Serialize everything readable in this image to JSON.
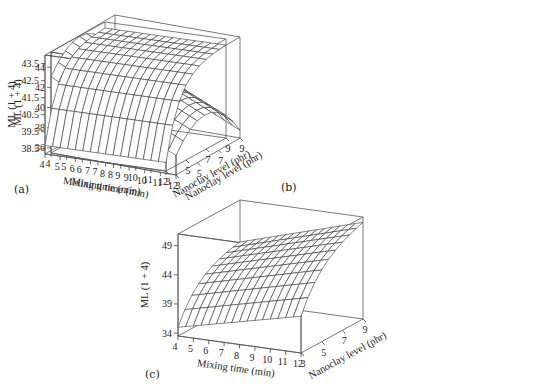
{
  "figure": {
    "panels": [
      {
        "label": "(a)",
        "ylabel": "ML (1 + 4)",
        "xlabel": "Mixing time (min)",
        "zlabel": "Nanoclay level (phr)",
        "yticks": [
          "36",
          "38",
          "40",
          "42",
          "44"
        ],
        "xticks": [
          "4",
          "5",
          "6",
          "7",
          "8",
          "9",
          "10",
          "11",
          "12"
        ],
        "zticks": [
          "3",
          "5",
          "7",
          "9"
        ]
      },
      {
        "label": "(b)",
        "ylabel": "ML (1 + 4)",
        "xlabel": "Mixing time (min)",
        "zlabel": "Nanoclay level (phr)",
        "yticks": [
          "38.5",
          "39.5",
          "40.5",
          "41.5",
          "42.5",
          "43.5"
        ],
        "xticks": [
          "4",
          "5",
          "6",
          "7",
          "8",
          "9",
          "10",
          "11",
          "12"
        ],
        "zticks": [
          "3",
          "5",
          "7",
          "9"
        ]
      },
      {
        "label": "(c)",
        "ylabel": "ML (1 + 4)",
        "xlabel": "Mixing time (min)",
        "zlabel": "Nanoclay level (phr)",
        "yticks": [
          "34",
          "39",
          "44",
          "49"
        ],
        "xticks": [
          "4",
          "5",
          "6",
          "7",
          "8",
          "9",
          "10",
          "11",
          "12"
        ],
        "zticks": [
          "3",
          "5",
          "7",
          "9"
        ]
      }
    ]
  },
  "chart_data": [
    {
      "type": "surface",
      "title": "(a)",
      "xlabel": "Mixing time (min)",
      "ylabel": "Nanoclay level (phr)",
      "zlabel": "ML (1 + 4)",
      "x_range": [
        4,
        12
      ],
      "y_range": [
        3,
        9
      ],
      "z_range": [
        35.5,
        45.5
      ],
      "x_ticks": [
        4,
        5,
        6,
        7,
        8,
        9,
        10,
        11,
        12
      ],
      "y_ticks": [
        3,
        5,
        7,
        9
      ],
      "z_ticks": [
        36,
        38,
        40,
        42,
        44
      ],
      "description": "Ridge-shaped surface: ML peaks at intermediate nanoclay level (~5-6 phr) and decreases linearly with mixing time",
      "samples": [
        {
          "x": 4,
          "y": 3,
          "z": 42.6
        },
        {
          "x": 4,
          "y": 6,
          "z": 45.0
        },
        {
          "x": 4,
          "y": 9,
          "z": 43.5
        },
        {
          "x": 12,
          "y": 3,
          "z": 37.0
        },
        {
          "x": 12,
          "y": 6,
          "z": 39.5
        },
        {
          "x": 12,
          "y": 9,
          "z": 38.0
        }
      ]
    },
    {
      "type": "surface",
      "title": "(b)",
      "xlabel": "Mixing time (min)",
      "ylabel": "Nanoclay level (phr)",
      "zlabel": "ML (1 + 4)",
      "x_range": [
        4,
        12
      ],
      "y_range": [
        3,
        9
      ],
      "z_range": [
        38.2,
        44
      ],
      "x_ticks": [
        4,
        5,
        6,
        7,
        8,
        9,
        10,
        11,
        12
      ],
      "y_ticks": [
        3,
        5,
        7,
        9
      ],
      "z_ticks": [
        38.5,
        39.5,
        40.5,
        41.5,
        42.5,
        43.5
      ],
      "description": "Surface rises steeply with nanoclay level and plateaus near 43.5; nearly independent of mixing time",
      "samples": [
        {
          "x": 4,
          "y": 3,
          "z": 38.7
        },
        {
          "x": 4,
          "y": 6,
          "z": 43.0
        },
        {
          "x": 4,
          "y": 9,
          "z": 43.7
        },
        {
          "x": 12,
          "y": 3,
          "z": 38.7
        },
        {
          "x": 12,
          "y": 6,
          "z": 43.0
        },
        {
          "x": 12,
          "y": 9,
          "z": 43.7
        }
      ]
    },
    {
      "type": "surface",
      "title": "(c)",
      "xlabel": "Mixing time (min)",
      "ylabel": "Nanoclay level (phr)",
      "zlabel": "ML (1 + 4)",
      "x_range": [
        4,
        12
      ],
      "y_range": [
        3,
        9
      ],
      "z_range": [
        33.5,
        51
      ],
      "x_ticks": [
        4,
        5,
        6,
        7,
        8,
        9,
        10,
        11,
        12
      ],
      "y_ticks": [
        3,
        5,
        7,
        9
      ],
      "z_ticks": [
        34,
        39,
        44,
        49
      ],
      "description": "Surface increases with both nanoclay level and mixing time, highest (~50) at 12 min, 9 phr",
      "samples": [
        {
          "x": 4,
          "y": 3,
          "z": 35.0
        },
        {
          "x": 4,
          "y": 6,
          "z": 42.5
        },
        {
          "x": 4,
          "y": 9,
          "z": 44.5
        },
        {
          "x": 12,
          "y": 3,
          "z": 39.5
        },
        {
          "x": 12,
          "y": 6,
          "z": 47.5
        },
        {
          "x": 12,
          "y": 9,
          "z": 50.0
        }
      ]
    }
  ]
}
